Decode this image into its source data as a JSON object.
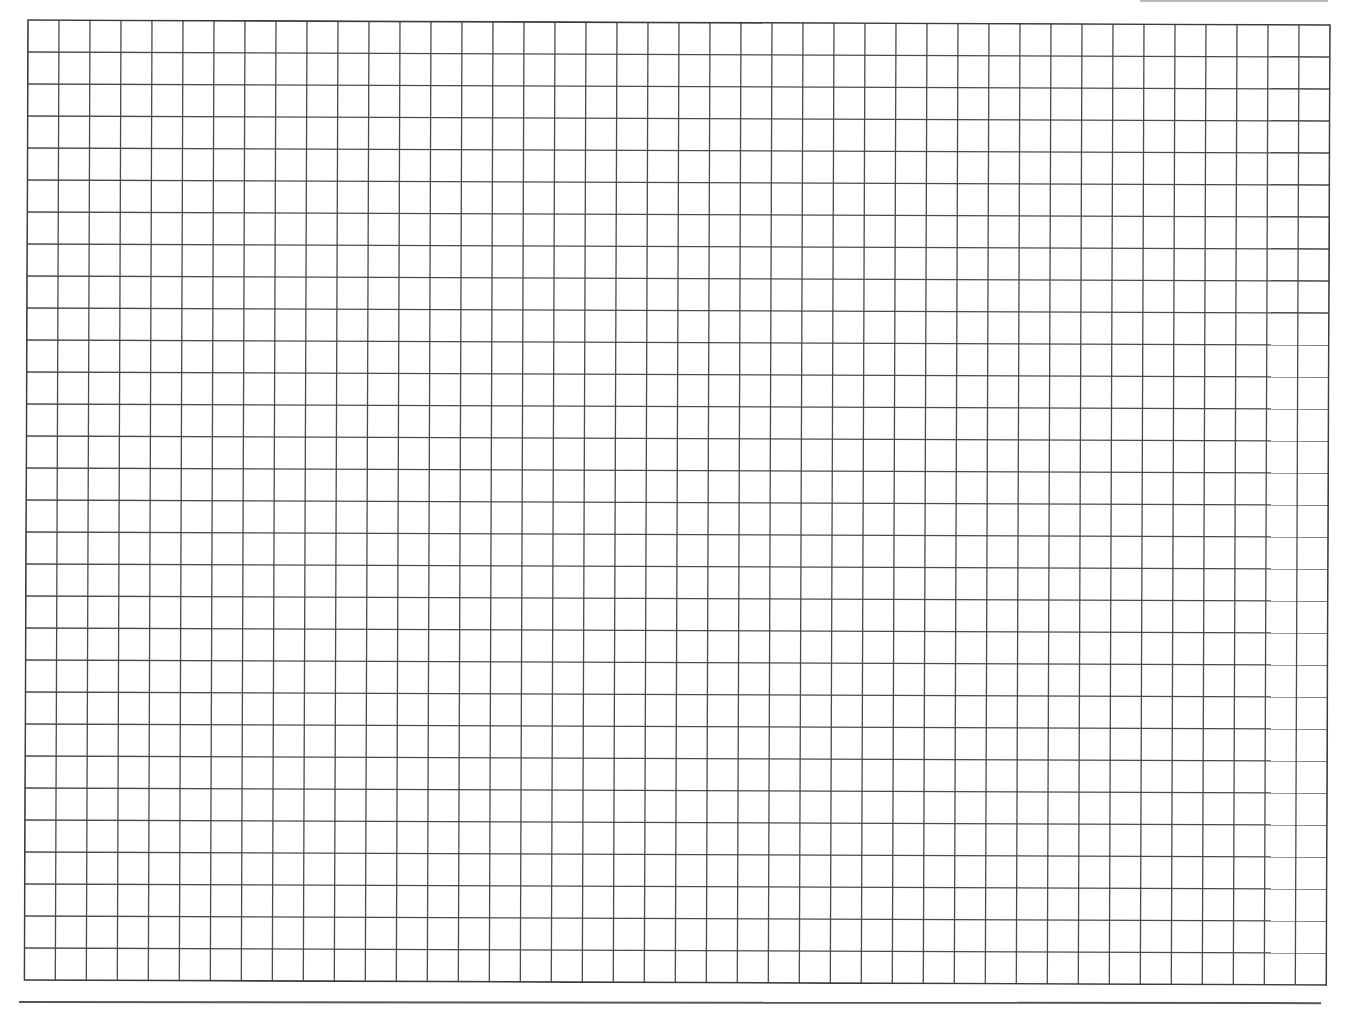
{
  "sheet": {
    "type": "graph-paper",
    "background_color": "#ffffff",
    "line_color": "#4a4a4a",
    "border_color": "#3c3c3c",
    "grid": {
      "columns": 42,
      "rows": 30,
      "cell_width": 31,
      "cell_height": 32
    },
    "top_rule_color": "#9a9a9a",
    "bottom_rule_color": "#555555"
  }
}
